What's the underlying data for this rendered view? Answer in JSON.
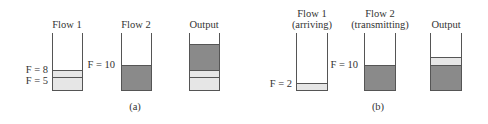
{
  "panels": [
    {
      "caption": "(a)",
      "queues": [
        {
          "title": "Flow 1",
          "levels": [
            "F = 8",
            "F = 5"
          ]
        },
        {
          "title": "Flow 2",
          "levels": [
            "F = 10"
          ]
        },
        {
          "title": "Output",
          "levels": []
        }
      ]
    },
    {
      "caption": "(b)",
      "queues": [
        {
          "title": "Flow 1",
          "subtitle": "(arriving)",
          "levels": [
            "F = 2"
          ]
        },
        {
          "title": "Flow 2",
          "subtitle": "(transmitting)",
          "levels": [
            "F = 10"
          ]
        },
        {
          "title": "Output",
          "levels": []
        }
      ]
    }
  ],
  "colors": {
    "light_packet": "#e6e6e6",
    "dark_packet": "#8a8a8a",
    "outline": "#555555"
  }
}
